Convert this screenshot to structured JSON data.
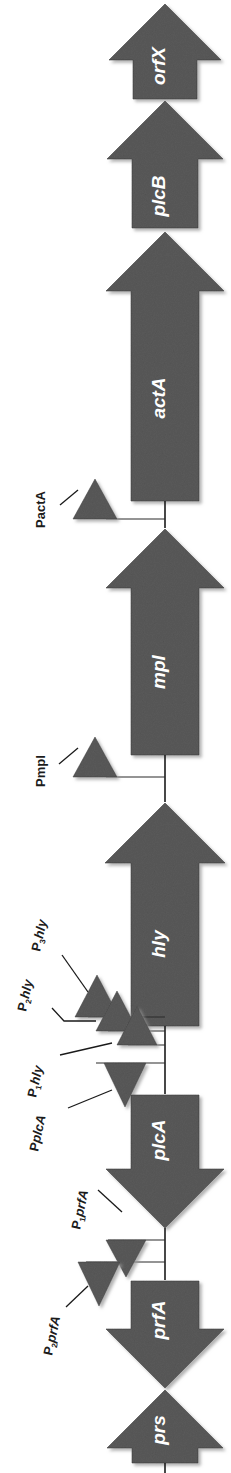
{
  "figure": {
    "type": "gene-cluster-map",
    "orientation": "vertical-rotated",
    "organism_locus": "Listeria monocytogenes virulence gene cluster (LIPI-1)",
    "background_color": "#ffffff",
    "feature_fill_color": "#5a5a5a",
    "feature_outline_color": "#3c3c3c",
    "label_color_on_feature": "#ffffff",
    "label_color_on_background": "#1c1c1c"
  },
  "genes": [
    {
      "id": "orfX",
      "label": "orfX",
      "direction": "up",
      "length": "short"
    },
    {
      "id": "plcB",
      "label": "plcB",
      "direction": "up",
      "length": "short"
    },
    {
      "id": "actA",
      "label": "actA",
      "direction": "up",
      "length": "long"
    },
    {
      "id": "mpl",
      "label": "mpl",
      "direction": "up",
      "length": "long"
    },
    {
      "id": "hly",
      "label": "hly",
      "direction": "up",
      "length": "long"
    },
    {
      "id": "plcA",
      "label": "plcA",
      "direction": "down",
      "length": "medium"
    },
    {
      "id": "prfA",
      "label": "prfA",
      "direction": "down",
      "length": "medium"
    },
    {
      "id": "prs",
      "label": "prs",
      "direction": "up",
      "length": "short"
    }
  ],
  "promoters": [
    {
      "id": "PactA",
      "prefix": "P",
      "subscript": "",
      "gene": "actA",
      "direction": "up",
      "label_full": "PactA"
    },
    {
      "id": "Pmpl",
      "prefix": "P",
      "subscript": "",
      "gene": "mpl",
      "direction": "up",
      "label_full": "Pmpl"
    },
    {
      "id": "P3hly",
      "prefix": "P",
      "subscript": "3",
      "gene": "hly",
      "direction": "up",
      "label_full": "P3hly"
    },
    {
      "id": "P2hly",
      "prefix": "P",
      "subscript": "2",
      "gene": "hly",
      "direction": "up",
      "label_full": "P2hly"
    },
    {
      "id": "P1hly",
      "prefix": "P",
      "subscript": "1",
      "gene": "hly",
      "direction": "up",
      "label_full": "P1hly"
    },
    {
      "id": "PplcA",
      "prefix": "P",
      "subscript": "",
      "gene": "plcA",
      "direction": "down",
      "label_full": "PplcA"
    },
    {
      "id": "P1prfA",
      "prefix": "P",
      "subscript": "1",
      "gene": "prfA",
      "direction": "down",
      "label_full": "P1prfA"
    },
    {
      "id": "P2prfA",
      "prefix": "P",
      "subscript": "2",
      "gene": "prfA",
      "direction": "down",
      "label_full": "P2prfA"
    }
  ]
}
